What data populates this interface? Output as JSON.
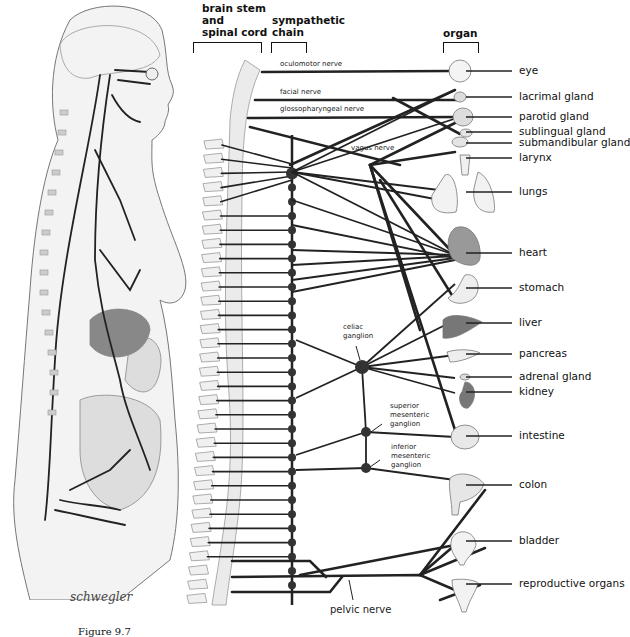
{
  "headers": {
    "brain_stem": [
      "brain stem",
      "and",
      "spinal cord"
    ],
    "sympathetic_chain": [
      "sympathetic",
      "chain"
    ],
    "organ": "organ"
  },
  "cranial_nerves": [
    {
      "label": "oculomotor nerve"
    },
    {
      "label": "facial nerve"
    },
    {
      "label": "glossopharyngeal nerve"
    },
    {
      "label": "vagus nerve"
    }
  ],
  "ganglia": {
    "celiac": [
      "celiac",
      "ganglion"
    ],
    "superior_mesenteric": [
      "superior",
      "mesenteric",
      "ganglion"
    ],
    "inferior_mesenteric": [
      "inferior",
      "mesenteric",
      "ganglion"
    ]
  },
  "organs": [
    {
      "id": "eye",
      "label": "eye"
    },
    {
      "id": "lacrimal-gland",
      "label": "lacrimal gland"
    },
    {
      "id": "parotid-gland",
      "label": "parotid gland"
    },
    {
      "id": "sublingual-gland",
      "label": "sublingual gland"
    },
    {
      "id": "submandibular-gland",
      "label": "submandibular gland"
    },
    {
      "id": "larynx",
      "label": "larynx"
    },
    {
      "id": "lungs",
      "label": "lungs"
    },
    {
      "id": "heart",
      "label": "heart"
    },
    {
      "id": "stomach",
      "label": "stomach"
    },
    {
      "id": "liver",
      "label": "liver"
    },
    {
      "id": "pancreas",
      "label": "pancreas"
    },
    {
      "id": "adrenal-gland",
      "label": "adrenal gland"
    },
    {
      "id": "kidney",
      "label": "kidney"
    },
    {
      "id": "intestine",
      "label": "intestine"
    },
    {
      "id": "colon",
      "label": "colon"
    },
    {
      "id": "bladder",
      "label": "bladder"
    },
    {
      "id": "reproductive-organs",
      "label": "reproductive organs"
    }
  ],
  "pelvic_nerve_label": "pelvic nerve",
  "signature": "schwegler",
  "caption": "Figure 9.7"
}
